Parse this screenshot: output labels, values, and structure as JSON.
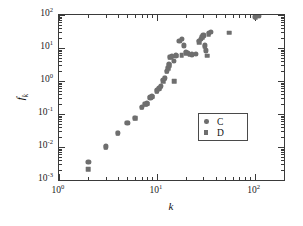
{
  "chart_data": {
    "type": "scatter",
    "title": "",
    "xlabel": "k",
    "ylabel": "f_k",
    "xscale": "log",
    "yscale": "log",
    "xlim": [
      1,
      200
    ],
    "ylim": [
      0.001,
      100
    ],
    "grid": false,
    "legend_position": "lower-right-inside",
    "xticklabel_values": [
      "10^0",
      "10^1",
      "10^2"
    ],
    "yticklabel_values": [
      "10^-3",
      "10^-2",
      "10^-1",
      "10^0",
      "10^1",
      "10^2"
    ],
    "xtick_labels": [
      {
        "value": 1,
        "mantissa": "10",
        "exponent": "0"
      },
      {
        "value": 10,
        "mantissa": "10",
        "exponent": "1"
      },
      {
        "value": 100,
        "mantissa": "10",
        "exponent": "2"
      }
    ],
    "ytick_labels": [
      {
        "value": 0.001,
        "mantissa": "10",
        "exponent": "-3"
      },
      {
        "value": 0.01,
        "mantissa": "10",
        "exponent": "-2"
      },
      {
        "value": 0.1,
        "mantissa": "10",
        "exponent": "-1"
      },
      {
        "value": 1,
        "mantissa": "10",
        "exponent": "0"
      },
      {
        "value": 10,
        "mantissa": "10",
        "exponent": "1"
      },
      {
        "value": 100,
        "mantissa": "10",
        "exponent": "2"
      }
    ],
    "series": [
      {
        "name": "C",
        "marker": "circle",
        "color": "#6e6e6e",
        "points": [
          [
            2,
            0.0036
          ],
          [
            3,
            0.0104
          ],
          [
            4,
            0.026
          ],
          [
            5,
            0.055
          ],
          [
            6,
            0.075
          ],
          [
            7,
            0.16
          ],
          [
            7.6,
            0.2
          ],
          [
            8,
            0.21
          ],
          [
            8.6,
            0.32
          ],
          [
            9,
            0.34
          ],
          [
            10,
            0.52
          ],
          [
            10.6,
            0.6
          ],
          [
            11,
            0.7
          ],
          [
            11.6,
            1.05
          ],
          [
            12,
            1.25
          ],
          [
            12.6,
            2.0
          ],
          [
            13,
            2.5
          ],
          [
            13.4,
            3.2
          ],
          [
            13.8,
            5.4
          ],
          [
            14.2,
            5.7
          ],
          [
            15,
            4.0
          ],
          [
            15.8,
            6.0
          ],
          [
            17,
            16
          ],
          [
            18,
            19
          ],
          [
            19,
            12
          ],
          [
            20,
            7.5
          ],
          [
            21,
            7.2
          ],
          [
            23,
            6.4
          ],
          [
            25,
            6.6
          ],
          [
            27,
            16
          ],
          [
            28,
            19
          ],
          [
            29,
            22
          ],
          [
            30,
            24
          ],
          [
            31,
            12
          ],
          [
            32,
            8.5
          ],
          [
            34,
            28
          ],
          [
            36,
            30
          ],
          [
            100,
            88
          ],
          [
            110,
            92
          ]
        ]
      },
      {
        "name": "D",
        "marker": "square",
        "color": "#6e6e6e",
        "points": [
          [
            2,
            0.0021
          ],
          [
            3,
            0.01
          ],
          [
            4,
            0.026
          ],
          [
            5,
            0.054
          ],
          [
            6,
            0.074
          ],
          [
            7,
            0.155
          ],
          [
            7.6,
            0.195
          ],
          [
            8,
            0.205
          ],
          [
            8.6,
            0.31
          ],
          [
            9,
            0.33
          ],
          [
            10,
            0.5
          ],
          [
            10.6,
            0.58
          ],
          [
            11,
            0.68
          ],
          [
            11.6,
            1.0
          ],
          [
            12,
            1.2
          ],
          [
            12.6,
            1.9
          ],
          [
            13,
            2.4
          ],
          [
            13.4,
            3.0
          ],
          [
            13.8,
            5.2
          ],
          [
            14.2,
            5.5
          ],
          [
            15,
            1.0
          ],
          [
            16,
            5.8
          ],
          [
            18,
            6.0
          ],
          [
            20,
            6.9
          ],
          [
            22,
            6.2
          ],
          [
            27,
            15
          ],
          [
            29,
            21
          ],
          [
            31,
            11
          ],
          [
            33,
            5.8
          ],
          [
            34,
            26
          ],
          [
            55,
            29
          ],
          [
            103,
            86
          ]
        ]
      }
    ]
  },
  "axes": {
    "x_title": "k",
    "y_title_main": "f",
    "y_title_sub": "k"
  },
  "legend": {
    "entries": [
      {
        "label": "C",
        "marker": "circle"
      },
      {
        "label": "D",
        "marker": "square"
      }
    ]
  },
  "colors": {
    "marker": "#6e6e6e",
    "frame": "#3a3a3a",
    "text": "#111111",
    "background": "#ffffff"
  }
}
